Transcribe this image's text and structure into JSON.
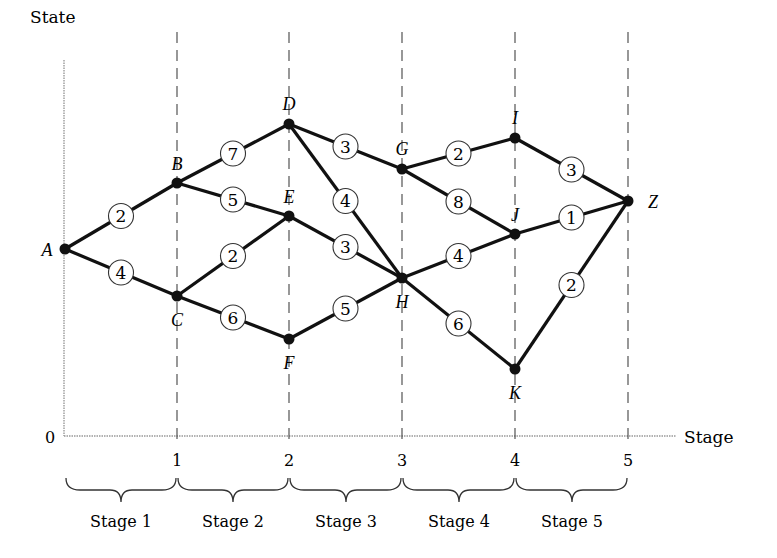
{
  "diagram": {
    "y_axis_label": "State",
    "x_axis_label": "Stage",
    "origin_label": "0",
    "x_ticks": [
      "1",
      "2",
      "3",
      "4",
      "5"
    ],
    "stage_labels": [
      "Stage 1",
      "Stage 2",
      "Stage 3",
      "Stage 4",
      "Stage 5"
    ],
    "nodes": [
      {
        "id": "A",
        "label": "A",
        "stage": 0,
        "x": 65,
        "y": 249
      },
      {
        "id": "B",
        "label": "B",
        "stage": 1,
        "x": 177,
        "y": 183
      },
      {
        "id": "C",
        "label": "C",
        "stage": 1,
        "x": 177,
        "y": 296
      },
      {
        "id": "D",
        "label": "D",
        "stage": 2,
        "x": 289,
        "y": 124
      },
      {
        "id": "E",
        "label": "E",
        "stage": 2,
        "x": 289,
        "y": 216
      },
      {
        "id": "F",
        "label": "F",
        "stage": 2,
        "x": 289,
        "y": 339
      },
      {
        "id": "G",
        "label": "G",
        "stage": 3,
        "x": 402,
        "y": 169
      },
      {
        "id": "H",
        "label": "H",
        "stage": 3,
        "x": 402,
        "y": 278
      },
      {
        "id": "I",
        "label": "I",
        "stage": 4,
        "x": 515,
        "y": 138
      },
      {
        "id": "J",
        "label": "J",
        "stage": 4,
        "x": 515,
        "y": 234
      },
      {
        "id": "K",
        "label": "K",
        "stage": 4,
        "x": 515,
        "y": 369
      },
      {
        "id": "Z",
        "label": "Z",
        "stage": 5,
        "x": 628,
        "y": 201
      }
    ],
    "edges": [
      {
        "from": "A",
        "to": "B",
        "weight": "2"
      },
      {
        "from": "A",
        "to": "C",
        "weight": "4"
      },
      {
        "from": "B",
        "to": "D",
        "weight": "7"
      },
      {
        "from": "B",
        "to": "E",
        "weight": "5"
      },
      {
        "from": "C",
        "to": "E",
        "weight": "2"
      },
      {
        "from": "C",
        "to": "F",
        "weight": "6"
      },
      {
        "from": "D",
        "to": "G",
        "weight": "3"
      },
      {
        "from": "D",
        "to": "H",
        "weight": "4"
      },
      {
        "from": "E",
        "to": "H",
        "weight": "3"
      },
      {
        "from": "F",
        "to": "H",
        "weight": "5"
      },
      {
        "from": "G",
        "to": "I",
        "weight": "2"
      },
      {
        "from": "G",
        "to": "J",
        "weight": "8"
      },
      {
        "from": "H",
        "to": "J",
        "weight": "4"
      },
      {
        "from": "H",
        "to": "K",
        "weight": "6"
      },
      {
        "from": "I",
        "to": "Z",
        "weight": "3"
      },
      {
        "from": "J",
        "to": "Z",
        "weight": "1"
      },
      {
        "from": "K",
        "to": "Z",
        "weight": "2"
      }
    ]
  }
}
